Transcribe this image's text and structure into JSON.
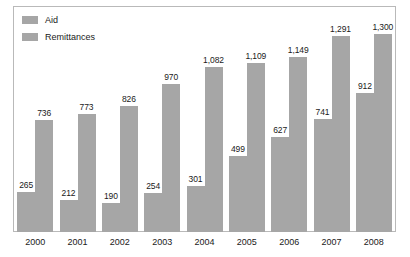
{
  "chart_data": {
    "type": "bar",
    "title": "",
    "subtitle": "",
    "xlabel": "",
    "ylabel": "",
    "grid": false,
    "legend_position": "top-left",
    "ylim": [
      0,
      1400
    ],
    "categories": [
      "2000",
      "2001",
      "2002",
      "2003",
      "2004",
      "2005",
      "2006",
      "2007",
      "2008"
    ],
    "series": [
      {
        "name": "Aid",
        "color": "#a6a6a6",
        "values": [
          265,
          212,
          190,
          254,
          301,
          499,
          627,
          741,
          912
        ],
        "labels": [
          "265",
          "212",
          "190",
          "254",
          "301",
          "499",
          "627",
          "741",
          "912"
        ]
      },
      {
        "name": "Remittances",
        "color": "#a6a6a6",
        "values": [
          736,
          773,
          826,
          970,
          1082,
          1109,
          1149,
          1291,
          1300
        ],
        "labels": [
          "736",
          "773",
          "826",
          "970",
          "1,082",
          "1,109",
          "1,149",
          "1,291",
          "1,300"
        ]
      }
    ]
  },
  "legend": {
    "items": [
      {
        "label": "Aid",
        "color": "#a6a6a6"
      },
      {
        "label": "Remittances",
        "color": "#a6a6a6"
      }
    ]
  },
  "colors": {
    "bar_fill": "#a6a6a6",
    "frame_border": "#b9b9b9",
    "text": "#1a1a1a",
    "background": "#ffffff"
  }
}
